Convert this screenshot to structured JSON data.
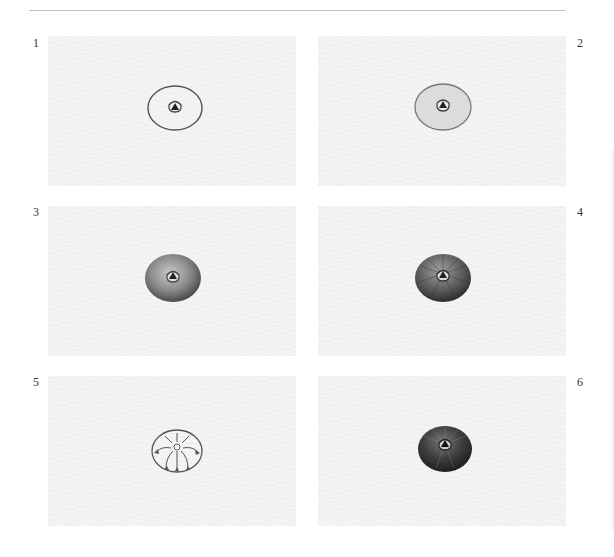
{
  "document": {
    "type": "step-by-step drawing illustration sheet",
    "steps": [
      {
        "number": "1",
        "description": "outline circle with small triangle center"
      },
      {
        "number": "2",
        "description": "light shading fill"
      },
      {
        "number": "3",
        "description": "darker gradient shading"
      },
      {
        "number": "4",
        "description": "radial ridge lines added"
      },
      {
        "number": "5",
        "description": "diagram of stroke directions with arrows"
      },
      {
        "number": "6",
        "description": "final dark shaded form"
      }
    ]
  },
  "colors": {
    "panel_bg": "#f4f4f3",
    "rule": "#bdbdbd",
    "ink": "#333333"
  }
}
